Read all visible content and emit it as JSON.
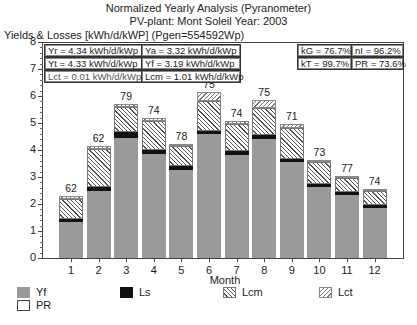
{
  "header": {
    "title": "Normalized Yearly Analysis (Pyranometer)",
    "subtitle": "PV-plant: Mont Soleil   Year: 2003",
    "y_axis_label": "Yields & Losses [kWh/d/kWP] (Pgen=554592Wp)"
  },
  "info_boxes": {
    "yr": "Yr = 4.34 kWh/d/kWp",
    "ya": "Ya = 3.32 kWh/d/kWp",
    "yt": "Yt = 4.33 kWh/d/kWp",
    "yf": "Yf = 3.19 kWh/d/kWp",
    "lct": "Lct = 0.01 kWh/d/kWp",
    "lcm": "Lcm = 1.01 kWh/d/kWp",
    "kg": "kG = 76.7%",
    "ni": "nI = 96.2%",
    "kt": "kT = 99.7%",
    "pr": "PR = 73.6%"
  },
  "y_ticks": [
    "0",
    "1",
    "2",
    "3",
    "4",
    "5",
    "6",
    "7",
    "8"
  ],
  "x_label": "Month",
  "x_ticks": [
    "1",
    "2",
    "3",
    "4",
    "5",
    "6",
    "7",
    "8",
    "9",
    "10",
    "11",
    "12"
  ],
  "legend": {
    "yf": "Yf",
    "ls": "Ls",
    "lcm": "Lcm",
    "lct": "Lct",
    "pr": "PR"
  },
  "colors": {
    "yf": "#9a9a9a",
    "ls": "#111111",
    "lcm": "hatched-diagonal",
    "lct": "hatched-diagonal-light"
  },
  "chart_data": {
    "type": "bar",
    "stacked": true,
    "title": "Normalized Yearly Analysis (Pyranometer)",
    "subtitle": "PV-plant: Mont Soleil   Year: 2003",
    "xlabel": "Month",
    "ylabel": "Yields & Losses [kWh/d/kWP] (Pgen=554592Wp)",
    "ylim": [
      0,
      8
    ],
    "grid": false,
    "legend_position": "bottom",
    "categories": [
      "1",
      "2",
      "3",
      "4",
      "5",
      "6",
      "7",
      "8",
      "9",
      "10",
      "11",
      "12"
    ],
    "series": [
      {
        "name": "Yf",
        "values": [
          1.33,
          2.47,
          4.46,
          3.84,
          3.25,
          4.58,
          3.8,
          4.39,
          3.54,
          2.62,
          2.32,
          1.85
        ]
      },
      {
        "name": "Ls",
        "values": [
          0.11,
          0.15,
          0.19,
          0.15,
          0.14,
          0.14,
          0.15,
          0.15,
          0.11,
          0.11,
          0.12,
          0.11
        ]
      },
      {
        "name": "Lcm",
        "values": [
          0.74,
          1.4,
          0.96,
          1.1,
          0.74,
          1.11,
          1.03,
          1.0,
          1.18,
          0.81,
          0.51,
          0.51
        ]
      },
      {
        "name": "Lct",
        "values": [
          0.11,
          0.11,
          0.11,
          0.11,
          0.08,
          0.3,
          0.11,
          0.33,
          0.15,
          0.08,
          0.08,
          0.08
        ]
      }
    ],
    "PR_labels": [
      62,
      62,
      79,
      74,
      78,
      75,
      74,
      75,
      71,
      73,
      77,
      74
    ],
    "annotations": [
      "Yr = 4.34 kWh/d/kWp",
      "Ya = 3.32 kWh/d/kWp",
      "Yt = 4.33 kWh/d/kWp",
      "Yf = 3.19 kWh/d/kWp",
      "Lct = 0.01 kWh/d/kWp",
      "Lcm = 1.01 kWh/d/kWp",
      "kG = 76.7%",
      "nI = 96.2%",
      "kT = 99.7%",
      "PR = 73.6%"
    ]
  }
}
